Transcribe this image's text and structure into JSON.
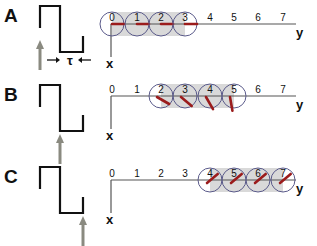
{
  "panels": [
    {
      "label": "A",
      "tau": "τ",
      "arrow_position": "start",
      "highlighted_sites": [
        0,
        1,
        2,
        3
      ],
      "spin_angles_deg": [
        0,
        0,
        0,
        0
      ],
      "ticks": [
        "0",
        "1",
        "2",
        "3",
        "4",
        "5",
        "6",
        "7"
      ],
      "x_axis": "x",
      "y_axis": "y"
    },
    {
      "label": "B",
      "arrow_position": "middle",
      "highlighted_sites": [
        2,
        3,
        4,
        5
      ],
      "spin_angles_deg": [
        30,
        40,
        60,
        80
      ],
      "ticks": [
        "0",
        "1",
        "2",
        "3",
        "4",
        "5",
        "6",
        "7"
      ],
      "x_axis": "x",
      "y_axis": "y"
    },
    {
      "label": "C",
      "arrow_position": "end",
      "highlighted_sites": [
        4,
        5,
        6,
        7
      ],
      "spin_angles_deg": [
        -40,
        -40,
        -40,
        -40
      ],
      "ticks": [
        "0",
        "1",
        "2",
        "3",
        "4",
        "5",
        "6",
        "7"
      ],
      "x_axis": "x",
      "y_axis": "y"
    }
  ],
  "colors": {
    "spin": "#9b1c1c",
    "circle": "#5a5a8a",
    "shade": "#d9d9d9",
    "arrow": "#8a8a80",
    "line": "#111111",
    "axis": "#555555"
  }
}
